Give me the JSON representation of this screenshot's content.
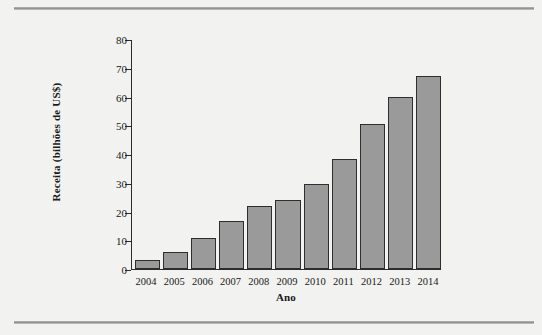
{
  "figure": {
    "background_color": "#f2f2f0",
    "rule_color": "#8e8e8c"
  },
  "chart_data": {
    "type": "bar",
    "title": "",
    "xlabel": "Ano",
    "ylabel": "Receita (bilhões de US$)",
    "categories": [
      "2004",
      "2005",
      "2006",
      "2007",
      "2008",
      "2009",
      "2010",
      "2011",
      "2012",
      "2013",
      "2014"
    ],
    "values": [
      3.2,
      6.0,
      10.8,
      16.6,
      22.0,
      24.0,
      29.7,
      38.3,
      50.5,
      60.0,
      67.0
    ],
    "ylim": [
      0,
      80
    ],
    "yticks": [
      0,
      10,
      20,
      30,
      40,
      50,
      60,
      70,
      80
    ],
    "ytick_labels": [
      "0",
      "10",
      "20",
      "30",
      "40",
      "50",
      "60",
      "70",
      "80"
    ],
    "grid": false,
    "legend": null,
    "bar_fill_color": "#9a9a9a",
    "bar_edge_color": "#2e2e2e"
  }
}
